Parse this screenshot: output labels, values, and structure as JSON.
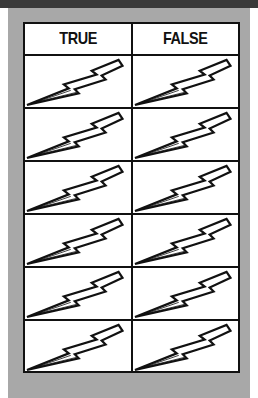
{
  "header": {
    "col_true": "TRUE",
    "col_false": "FALSE"
  },
  "rows": [
    {
      "true_icon": "lightning-bolt-icon",
      "false_icon": "lightning-bolt-icon"
    },
    {
      "true_icon": "lightning-bolt-icon",
      "false_icon": "lightning-bolt-icon"
    },
    {
      "true_icon": "lightning-bolt-icon",
      "false_icon": "lightning-bolt-icon"
    },
    {
      "true_icon": "lightning-bolt-icon",
      "false_icon": "lightning-bolt-icon"
    },
    {
      "true_icon": "lightning-bolt-icon",
      "false_icon": "lightning-bolt-icon"
    },
    {
      "true_icon": "lightning-bolt-icon",
      "false_icon": "lightning-bolt-icon"
    }
  ],
  "colors": {
    "panel": "#a8a8a8",
    "topbar": "#3a3a3a",
    "border": "#111111"
  }
}
